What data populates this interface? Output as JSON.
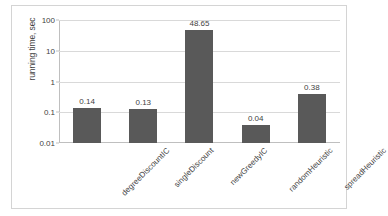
{
  "chart_data": {
    "type": "bar",
    "title": "",
    "xlabel": "",
    "ylabel": "running time, sec",
    "yscale": "log",
    "ylim": [
      0.01,
      100
    ],
    "grid": true,
    "legend": null,
    "ytick_labels": [
      "100",
      "10",
      "1",
      "0.1",
      "0.01"
    ],
    "ytick_values": [
      100,
      10,
      1,
      0.1,
      0.01
    ],
    "categories": [
      "degreeDiscountIC",
      "singleDiscount",
      "newGreedyIC",
      "randomHeuristic",
      "spreadHeuristic"
    ],
    "values": [
      0.14,
      0.13,
      48.65,
      0.04,
      0.38
    ],
    "value_labels": [
      "0.14",
      "0.13",
      "48.65",
      "0.04",
      "0.38"
    ],
    "bar_color": "#595959",
    "gridline_color": "#d9d9d9",
    "axis_color": "#bfbfbf",
    "text_color": "#3f3f3f"
  }
}
